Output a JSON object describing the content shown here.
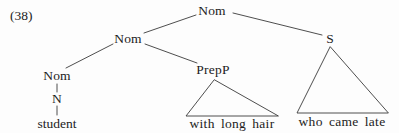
{
  "example": {
    "number": "(38)"
  },
  "tree": {
    "nodes": [
      {
        "id": "nom-top",
        "label": "Nom",
        "x": 212,
        "y": 11
      },
      {
        "id": "nom-mid",
        "label": "Nom",
        "x": 128,
        "y": 39
      },
      {
        "id": "s",
        "label": "S",
        "x": 330,
        "y": 39
      },
      {
        "id": "nom-low",
        "label": "Nom",
        "x": 57,
        "y": 76
      },
      {
        "id": "prepp",
        "label": "PrepP",
        "x": 213,
        "y": 70
      },
      {
        "id": "n",
        "label": "N",
        "x": 57,
        "y": 99
      }
    ],
    "terminals": [
      {
        "id": "student",
        "label": "student",
        "x": 57,
        "y": 124
      },
      {
        "id": "with-long-hair",
        "label": "with long hair",
        "x": 232,
        "y": 124
      },
      {
        "id": "who-came-late",
        "label": "who came late",
        "x": 342,
        "y": 122
      }
    ],
    "edges": [
      {
        "from": "nom-top",
        "to": "nom-mid"
      },
      {
        "from": "nom-top",
        "to": "s"
      },
      {
        "from": "nom-mid",
        "to": "nom-low"
      },
      {
        "from": "nom-mid",
        "to": "prepp"
      },
      {
        "from": "nom-low",
        "to": "n"
      },
      {
        "from": "n",
        "to": "student"
      }
    ],
    "triangles": [
      {
        "id": "prepp-triangle",
        "apex_x": 214,
        "apex_y": 80,
        "left_x": 186,
        "right_x": 278,
        "base_y": 116
      },
      {
        "id": "s-triangle",
        "apex_x": 330,
        "apex_y": 47,
        "left_x": 297,
        "right_x": 388,
        "base_y": 113
      }
    ],
    "line_color": "#3a3a3a"
  }
}
